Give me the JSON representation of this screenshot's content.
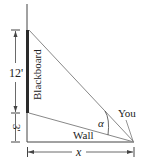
{
  "diagram": {
    "labels": {
      "blackboard": "Blackboard",
      "wall": "Wall",
      "you": "You",
      "angle": "α",
      "height_top": "12'",
      "height_bottom": "3'",
      "distance": "x"
    },
    "colors": {
      "line": "#333333",
      "sight_line": "#8a8a8a",
      "blackboard": "#2a2a2a"
    }
  }
}
